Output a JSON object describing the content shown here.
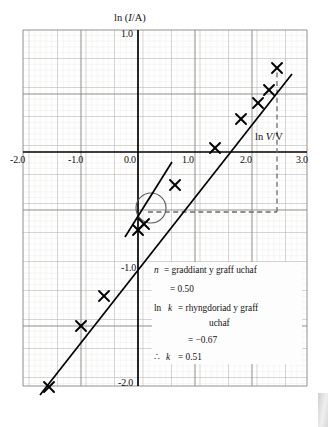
{
  "figure": {
    "kind": "log-log graph on graph paper",
    "x_axis": {
      "label": "ln V/V",
      "label_italic_part": "V",
      "ticks": [
        "-2.0",
        "-1.0",
        "0.0",
        "1.0",
        "2.0",
        "3.0"
      ],
      "tick_values": [
        -2.0,
        -1.0,
        0.0,
        1.0,
        2.0,
        3.0
      ],
      "min": -2.0,
      "max": 3.0
    },
    "y_axis": {
      "label": "ln (I/A)",
      "label_italic_part": "I",
      "ticks": [
        "1.0",
        "0.0",
        "-1.0",
        "-2.0"
      ],
      "tick_values": [
        1.0,
        0.0,
        -1.0,
        -2.0
      ],
      "min": -2.0,
      "max": 1.0
    },
    "annotation": {
      "line1_sym": "n",
      "line1_eq": "= graddiant y graff uchaf",
      "line2": "= 0.50",
      "line3_sym_a": "ln",
      "line3_sym_b": "k",
      "line3_eq": "= rhyngdoriad y graff",
      "line4": "uchaf",
      "line5": "= −0.67",
      "line6_sym_a": "∴",
      "line6_sym_b": "k",
      "line6_eq": "= 0.51"
    }
  },
  "chart_data": {
    "type": "scatter",
    "title": "",
    "xlabel": "ln V/V",
    "ylabel": "ln (I/A)",
    "xlim": [
      -2.0,
      3.0
    ],
    "ylim": [
      -2.0,
      1.0
    ],
    "grid": true,
    "legend": "none",
    "series": [
      {
        "name": "measured points",
        "marker": "cross",
        "x": [
          -1.55,
          -1.0,
          -0.6,
          0.0,
          0.1,
          0.65,
          1.35,
          1.8,
          2.1,
          2.3,
          2.45
        ],
        "y": [
          -1.77,
          -1.25,
          -0.99,
          -0.68,
          -0.63,
          -0.29,
          0.03,
          0.28,
          0.42,
          0.53,
          0.62
        ]
      },
      {
        "name": "best-fit line (graff uchaf)",
        "type": "line",
        "gradient": 0.5,
        "intercept": -0.67,
        "x_range": [
          -1.7,
          2.7
        ]
      },
      {
        "name": "steeper tangent line",
        "type": "line",
        "x_range": [
          -0.22,
          0.6
        ],
        "y_range": [
          -1.09,
          0.22
        ]
      }
    ],
    "guides": [
      {
        "name": "dashed-horizontal",
        "y": -0.52,
        "x_from": 0.18,
        "x_to": 2.45
      },
      {
        "name": "dashed-vertical",
        "x": 2.45,
        "y_from": -0.52,
        "y_to": 0.62
      }
    ],
    "highlight_circle": {
      "x": 0.22,
      "y": -0.48,
      "r_px": 15
    },
    "derived": {
      "n": 0.5,
      "ln_k": -0.67,
      "k": 0.51
    }
  }
}
